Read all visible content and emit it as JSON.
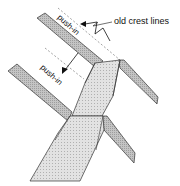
{
  "figure": {
    "labels": {
      "crest": "old crest lines",
      "push_upper": "push-in",
      "push_lower": "push-in"
    },
    "colors": {
      "band_fill": "#bdbdbd",
      "face_fill": "#dcdcdc",
      "face_dark": "#c8c8c8",
      "stroke": "#333333",
      "dash": "#8a8a8a"
    }
  }
}
